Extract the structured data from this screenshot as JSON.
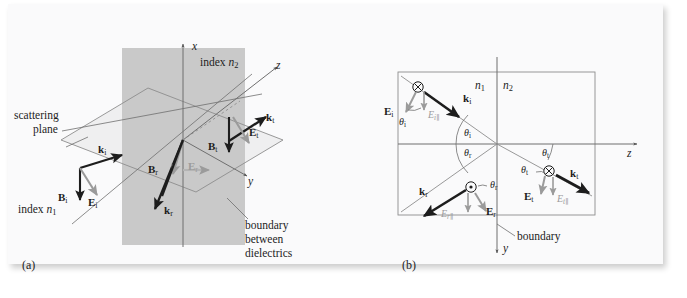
{
  "figure": {
    "caption_a": "(a)",
    "caption_b": "(b)",
    "background": "#fafafb",
    "ink": "#1d1d1d",
    "gray_ink": "#9b9b9b",
    "plane_fill": "#c9c9c9",
    "width": 687,
    "height": 298
  },
  "panel_a": {
    "label": "(a)",
    "axes": [
      {
        "name": "x-axis",
        "tick": "x"
      },
      {
        "name": "y-axis",
        "tick": "y"
      },
      {
        "name": "z-axis",
        "tick": "z"
      }
    ],
    "annotations": {
      "scattering_plane_line1": "scattering",
      "scattering_plane_line2": "plane",
      "index_n1_word": "index",
      "index_n1_sym": "n",
      "index_n1_sub": "1",
      "index_n2_word": "index",
      "index_n2_sym": "n",
      "index_n2_sub": "2",
      "boundary_line1": "boundary",
      "boundary_line2": "between",
      "boundary_line3": "dielectrics"
    },
    "vectors": [
      {
        "name": "k-incident",
        "symbol": "k",
        "sub": "i",
        "color": "black"
      },
      {
        "name": "B-incident",
        "symbol": "B",
        "sub": "i",
        "color": "black"
      },
      {
        "name": "E-incident",
        "symbol": "E",
        "sub": "i",
        "color": "gray"
      },
      {
        "name": "k-reflected",
        "symbol": "k",
        "sub": "r",
        "color": "black"
      },
      {
        "name": "B-reflected",
        "symbol": "B",
        "sub": "r",
        "color": "black"
      },
      {
        "name": "E-reflected",
        "symbol": "E",
        "sub": "r",
        "color": "gray"
      },
      {
        "name": "k-transmitted",
        "symbol": "k",
        "sub": "t",
        "color": "black"
      },
      {
        "name": "B-transmitted",
        "symbol": "B",
        "sub": "t",
        "color": "black"
      },
      {
        "name": "E-transmitted",
        "symbol": "E",
        "sub": "t",
        "color": "gray"
      }
    ]
  },
  "panel_b": {
    "label": "(b)",
    "axes": [
      {
        "name": "z-axis",
        "tick": "z"
      },
      {
        "name": "y-axis",
        "tick": "y"
      }
    ],
    "media": {
      "left_sym": "n",
      "left_sub": "1",
      "right_sym": "n",
      "right_sub": "2"
    },
    "boundary_label": "boundary",
    "angles": [
      {
        "name": "theta-incident-at-origin",
        "symbol": "θ",
        "sub": "i"
      },
      {
        "name": "theta-reflected-at-origin",
        "symbol": "θ",
        "sub": "r"
      },
      {
        "name": "theta-transmitted-at-origin",
        "symbol": "θ",
        "sub": "t"
      },
      {
        "name": "theta-incident-at-ray",
        "symbol": "θ",
        "sub": "i"
      },
      {
        "name": "theta-reflected-at-ray",
        "symbol": "θ",
        "sub": "r"
      },
      {
        "name": "theta-transmitted-at-ray",
        "symbol": "θ",
        "sub": "t"
      }
    ],
    "vectors": [
      {
        "name": "k-incident",
        "symbol": "k",
        "sub": "i"
      },
      {
        "name": "k-reflected",
        "symbol": "k",
        "sub": "r"
      },
      {
        "name": "k-transmitted",
        "symbol": "k",
        "sub": "t"
      }
    ],
    "fields": [
      {
        "name": "E-incident-perp",
        "symbol": "E",
        "sub": "i",
        "bold": true,
        "par": ""
      },
      {
        "name": "E-incident-par",
        "symbol": "E",
        "sub": "i",
        "bold": false,
        "par": "∥"
      },
      {
        "name": "E-reflected-perp",
        "symbol": "E",
        "sub": "r",
        "bold": true,
        "par": ""
      },
      {
        "name": "E-reflected-par",
        "symbol": "E",
        "sub": "r",
        "bold": false,
        "par": "∥"
      },
      {
        "name": "E-transmitted-perp",
        "symbol": "E",
        "sub": "t",
        "bold": true,
        "par": ""
      },
      {
        "name": "E-transmitted-par",
        "symbol": "E",
        "sub": "t",
        "bold": false,
        "par": "∥"
      }
    ],
    "polarization_markers": [
      {
        "name": "into-page-marker-incident",
        "glyph": "⊗"
      },
      {
        "name": "out-of-page-marker-reflected",
        "glyph": "⊙"
      },
      {
        "name": "into-page-marker-transmitted",
        "glyph": "⊗"
      }
    ]
  }
}
